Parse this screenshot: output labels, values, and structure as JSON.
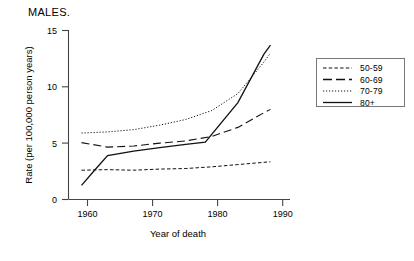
{
  "chart_data": {
    "type": "line",
    "title": "MALES.",
    "xlabel": "Year of death",
    "ylabel": "Rate (per 100,000 person years)",
    "xlim": [
      1957,
      1991
    ],
    "ylim": [
      0,
      15
    ],
    "xticks": [
      1960,
      1970,
      1980,
      1990
    ],
    "yticks": [
      0,
      5,
      10,
      15
    ],
    "grid": false,
    "legend_position": "right",
    "series": [
      {
        "name": "50-59",
        "style": "short-dash",
        "x": [
          1959,
          1963,
          1967,
          1971,
          1975,
          1979,
          1983,
          1987,
          1988
        ],
        "values": [
          2.6,
          2.65,
          2.6,
          2.7,
          2.75,
          2.9,
          3.1,
          3.3,
          3.35
        ]
      },
      {
        "name": "60-69",
        "style": "long-dash",
        "x": [
          1959,
          1963,
          1967,
          1971,
          1975,
          1979,
          1983,
          1987,
          1988
        ],
        "values": [
          5.05,
          4.65,
          4.75,
          5.0,
          5.2,
          5.6,
          6.4,
          7.7,
          8.0
        ]
      },
      {
        "name": "70-79",
        "style": "dotted",
        "x": [
          1959,
          1963,
          1967,
          1971,
          1975,
          1979,
          1983,
          1987,
          1988
        ],
        "values": [
          5.9,
          6.0,
          6.2,
          6.6,
          7.1,
          7.9,
          9.4,
          12.2,
          13.0
        ]
      },
      {
        "name": "80+",
        "style": "solid",
        "x": [
          1959,
          1961,
          1963,
          1967,
          1971,
          1975,
          1978,
          1983,
          1987,
          1988
        ],
        "values": [
          1.25,
          2.6,
          3.9,
          4.3,
          4.6,
          4.9,
          5.1,
          8.6,
          12.9,
          13.7
        ]
      }
    ]
  },
  "legend": {
    "entries": [
      {
        "label": "50-59"
      },
      {
        "label": "60-69"
      },
      {
        "label": "70-79"
      },
      {
        "label": "80+"
      }
    ]
  },
  "axis": {
    "y_tick_labels": [
      "15",
      "10",
      "5",
      "0"
    ],
    "x_tick_labels": [
      "1960",
      "1970",
      "1980",
      "1990"
    ]
  }
}
